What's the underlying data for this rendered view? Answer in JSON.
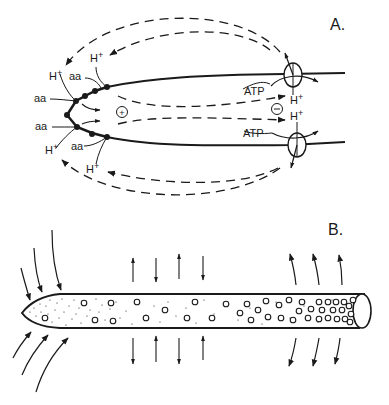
{
  "panels": [
    {
      "id": "A",
      "label": "A.",
      "description": "Pollen tube tip current loop: H+ and amino acid (aa) uptake at tip, ATP-driven H+ pumps at rear",
      "labels": {
        "h_plus": "H+",
        "h_base": "H",
        "plus_sup": "+",
        "aa": "aa",
        "atp": "ATP",
        "positive_sign": "+",
        "negative_sign": "−"
      }
    },
    {
      "id": "B",
      "label": "B.",
      "description": "Growing tube with vesicle gradient; inward current at tip, outward current at rear"
    }
  ],
  "colors": {
    "ink": "#1a1a1a",
    "background": "#ffffff"
  }
}
